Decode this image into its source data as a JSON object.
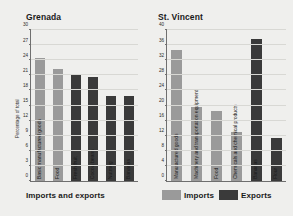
{
  "figure": {
    "caption": "Imports and exports",
    "background": "#efefed"
  },
  "legend": {
    "position": "bottom-right",
    "items": [
      {
        "label": "Imports",
        "color": "#9a9a9a"
      },
      {
        "label": "Exports",
        "color": "#3a3a3a"
      }
    ]
  },
  "colors": {
    "imports": "#9a9a9a",
    "exports": "#3a3a3a",
    "axis": "#6f6f6f",
    "grid": "#d8d8d4",
    "text": "#1a1a1a"
  },
  "chart_data": [
    {
      "type": "bar",
      "title": "Grenada",
      "xlabel": "",
      "ylabel": "Percentage of total",
      "ylim": [
        0,
        30
      ],
      "yticks": [
        0,
        3,
        6,
        9,
        12,
        15,
        18,
        21,
        24,
        27,
        30
      ],
      "grid": true,
      "legend_position": "bottom-right",
      "categories": [
        "Basic manufactured goods",
        "Food",
        "Fresh fruit",
        "Cocoa beans",
        "Nutmeg",
        "Bananas"
      ],
      "values": [
        24.5,
        22.3,
        21.0,
        20.7,
        16.8,
        16.8
      ],
      "series_of_bar": [
        "Imports",
        "Imports",
        "Exports",
        "Exports",
        "Exports",
        "Exports"
      ]
    },
    {
      "type": "bar",
      "title": "St. Vincent",
      "xlabel": "",
      "ylabel": "",
      "ylim": [
        0,
        40
      ],
      "yticks": [
        0,
        4,
        8,
        12,
        16,
        20,
        24,
        28,
        32,
        36,
        40
      ],
      "grid": true,
      "legend_position": "bottom-right",
      "categories": [
        "Manufactured goods",
        "Machinery and transportation equipment",
        "Food",
        "Chemicals and chemical products",
        "Bananas",
        "Flour"
      ],
      "values": [
        34.8,
        19.5,
        18.5,
        13.0,
        37.5,
        11.5
      ],
      "series_of_bar": [
        "Imports",
        "Imports",
        "Imports",
        "Imports",
        "Exports",
        "Exports"
      ]
    }
  ]
}
